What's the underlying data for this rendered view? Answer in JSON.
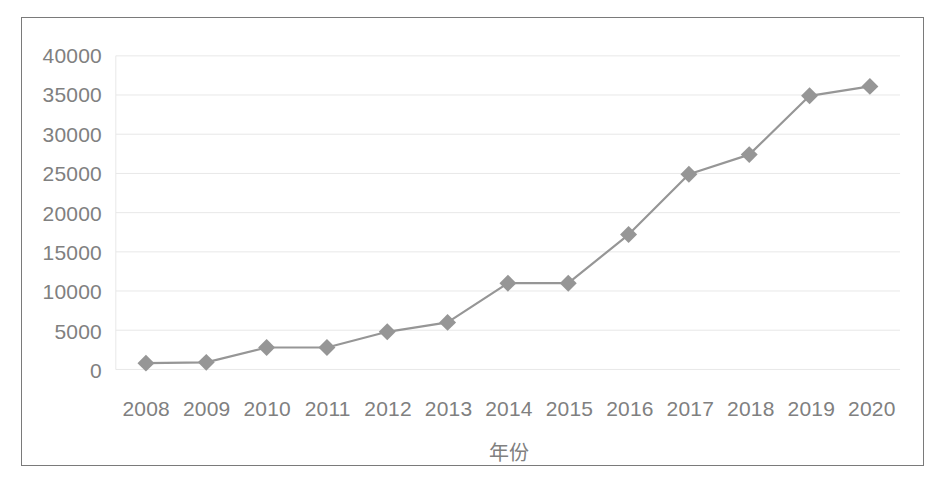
{
  "chart_data": {
    "type": "line",
    "title": "",
    "subtitle": "",
    "xlabel": "年份",
    "ylabel": "",
    "categories": [
      "2008",
      "2009",
      "2010",
      "2011",
      "2012",
      "2013",
      "2014",
      "2015",
      "2016",
      "2017",
      "2018",
      "2019",
      "2020"
    ],
    "values": [
      800,
      900,
      2800,
      2800,
      4800,
      6000,
      11000,
      11000,
      17200,
      24900,
      27400,
      34900,
      36100
    ],
    "series": [
      {
        "name": "",
        "values": [
          800,
          900,
          2800,
          2800,
          4800,
          6000,
          11000,
          11000,
          17200,
          24900,
          27400,
          34900,
          36100
        ]
      }
    ],
    "ylim": [
      0,
      40000
    ],
    "y_ticks": [
      0,
      5000,
      10000,
      15000,
      20000,
      25000,
      30000,
      35000,
      40000
    ],
    "y_tick_labels": [
      "0",
      "5000",
      "10000",
      "15000",
      "20000",
      "25000",
      "30000",
      "35000",
      "40000"
    ],
    "x_tick_labels": [
      "2008",
      "2009",
      "2010",
      "2011",
      "2012",
      "2013",
      "2014",
      "2015",
      "2016",
      "2017",
      "2018",
      "2019",
      "2020"
    ],
    "grid": true,
    "grid_axis": "y",
    "legend": false,
    "legend_position": "none",
    "marker": "diamond",
    "annotations": []
  },
  "style": {
    "line_color": "#969696",
    "marker_color": "#969696",
    "grid_color": "#e8e8e8",
    "tick_label_color": "#808080",
    "axis_title_color": "#808080",
    "frame_color": "#7a7a7a",
    "plot_background": "#ffffff"
  }
}
